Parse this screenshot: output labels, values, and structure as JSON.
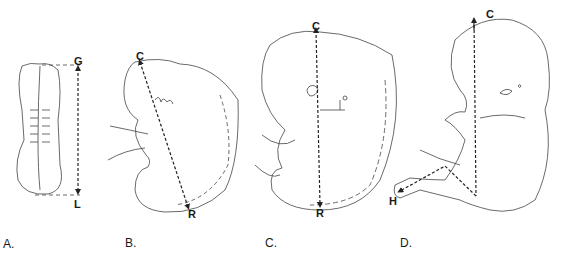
{
  "figure": {
    "panels": [
      {
        "id": "A",
        "label": "A.",
        "measure": {
          "start": "G",
          "end": "L"
        },
        "description": "greatest length"
      },
      {
        "id": "B",
        "label": "B.",
        "measure": {
          "start": "C",
          "end": "R"
        },
        "description": "crown-rump length"
      },
      {
        "id": "C",
        "label": "C.",
        "measure": {
          "start": "C",
          "end": "R"
        },
        "description": "crown-rump length"
      },
      {
        "id": "D",
        "label": "D.",
        "measure": {
          "start": "C",
          "end": "H"
        },
        "description": "crown-heel length"
      }
    ]
  },
  "colors": {
    "line": "#333333",
    "background": "#ffffff"
  }
}
